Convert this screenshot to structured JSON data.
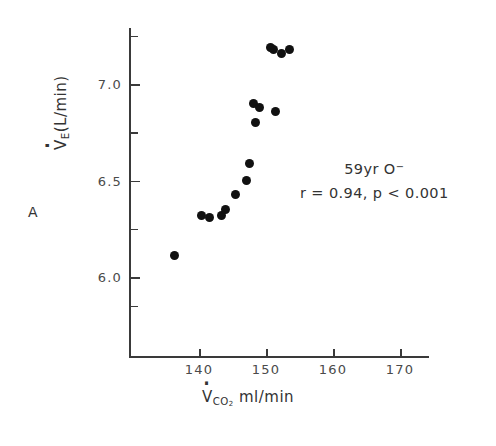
{
  "figure": {
    "panel_label": "A",
    "annotation_line1": "59yr O",
    "annotation_line1_sup": "−",
    "annotation_line2": "r = 0.94,  p < 0.001"
  },
  "chart_data": {
    "type": "scatter",
    "title": "",
    "xlabel": "VCO2 ml/min",
    "ylabel": "VE (L/min)",
    "xlabel_parts": {
      "symbol": "V",
      "subscript": "CO",
      "subscript2": "2",
      "units": "ml/min"
    },
    "ylabel_parts": {
      "symbol": "V",
      "subscript": "E",
      "units": "(L/min)"
    },
    "xlim": [
      133,
      177
    ],
    "ylim": [
      5.75,
      7.4
    ],
    "xticks": [
      140,
      150,
      160,
      170
    ],
    "xtick_labels": [
      "140",
      "150",
      "160",
      "170"
    ],
    "x_minor_ticks": [],
    "yticks": [
      6.0,
      6.5,
      7.0
    ],
    "ytick_labels": [
      "6.0",
      "6.5",
      "7.0"
    ],
    "y_minor_ticks": [
      5.85,
      6.25,
      6.75,
      7.25
    ],
    "grid": false,
    "legend": null,
    "marker": "filled-circle",
    "marker_color": "#111111",
    "points": [
      {
        "x": 136.4,
        "y": 6.11
      },
      {
        "x": 140.3,
        "y": 6.32
      },
      {
        "x": 141.5,
        "y": 6.31
      },
      {
        "x": 143.4,
        "y": 6.32
      },
      {
        "x": 144.0,
        "y": 6.35
      },
      {
        "x": 145.5,
        "y": 6.43
      },
      {
        "x": 147.1,
        "y": 6.5
      },
      {
        "x": 147.6,
        "y": 6.59
      },
      {
        "x": 148.4,
        "y": 6.8
      },
      {
        "x": 148.1,
        "y": 6.9
      },
      {
        "x": 151.4,
        "y": 6.86
      },
      {
        "x": 151.1,
        "y": 7.18
      },
      {
        "x": 152.3,
        "y": 7.16
      },
      {
        "x": 153.5,
        "y": 7.18
      },
      {
        "x": 150.7,
        "y": 7.19
      },
      {
        "x": 149.0,
        "y": 6.88
      }
    ],
    "stats": {
      "r": 0.94,
      "p_text": "< 0.001",
      "subject_age": 59,
      "subject_group": "O−"
    }
  }
}
